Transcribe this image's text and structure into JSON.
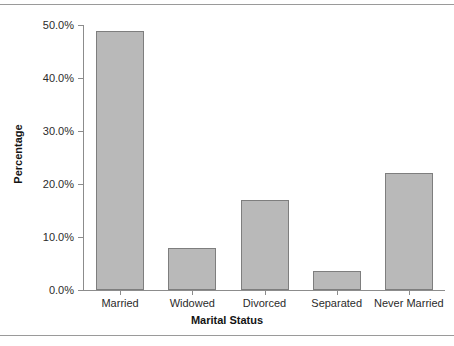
{
  "chart_data": {
    "type": "bar",
    "title": "",
    "xlabel": "Marital Status",
    "ylabel": "Percentage",
    "categories": [
      "Married",
      "Widowed",
      "Divorced",
      "Separated",
      "Never Married"
    ],
    "values": [
      48.8,
      8.0,
      17.0,
      3.6,
      22.0
    ],
    "ylim": [
      0,
      50
    ],
    "ytick_labels": [
      "0.0%",
      "10.0%",
      "20.0%",
      "30.0%",
      "40.0%",
      "50.0%"
    ],
    "ytick_values": [
      0,
      10,
      20,
      30,
      40,
      50
    ],
    "grid": false,
    "legend": false,
    "bar_color": "#b9b9b9",
    "bar_border_color": "#7e7e7e",
    "axis_color": "#8c8c8c",
    "text_color": "#2b2b2b"
  }
}
